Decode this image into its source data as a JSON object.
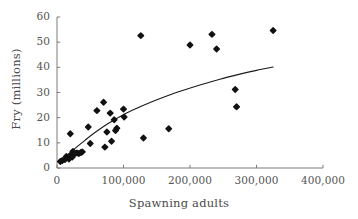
{
  "chart_data": {
    "type": "scatter",
    "title": "",
    "subtitle": "",
    "xlabel": "Spawning adults",
    "ylabel": "Fry (millions)",
    "xlim": [
      0,
      400000
    ],
    "ylim": [
      0,
      60
    ],
    "xticks": [
      0,
      100000,
      200000,
      300000,
      400000
    ],
    "xtick_labels": [
      "0",
      "100,000",
      "200,000",
      "300,000",
      "400,000"
    ],
    "yticks": [
      0,
      10,
      20,
      30,
      40,
      50,
      60
    ],
    "ytick_labels": [
      "0",
      "10",
      "20",
      "30",
      "40",
      "50",
      "60"
    ],
    "grid": false,
    "legend": null,
    "legend_position": "none",
    "marker": {
      "shape": "diamond",
      "color": "#111111",
      "size_px": 5.4
    },
    "series": [
      {
        "name": "Fry vs spawning adults",
        "type": "scatter",
        "points": [
          [
            5000,
            2.6
          ],
          [
            8000,
            3.0
          ],
          [
            12000,
            3.4
          ],
          [
            14000,
            4.6
          ],
          [
            18000,
            3.6
          ],
          [
            20000,
            13.6
          ],
          [
            21000,
            5.2
          ],
          [
            23000,
            4.4
          ],
          [
            24000,
            6.6
          ],
          [
            26000,
            5.6
          ],
          [
            30000,
            6.0
          ],
          [
            33000,
            5.8
          ],
          [
            36000,
            6.2
          ],
          [
            38000,
            6.4
          ],
          [
            47000,
            16.3
          ],
          [
            50000,
            9.7
          ],
          [
            60000,
            22.8
          ],
          [
            70000,
            26.1
          ],
          [
            72000,
            8.3
          ],
          [
            75000,
            14.3
          ],
          [
            80000,
            21.8
          ],
          [
            82000,
            10.6
          ],
          [
            86000,
            19.2
          ],
          [
            88000,
            14.9
          ],
          [
            90000,
            15.8
          ],
          [
            100000,
            23.4
          ],
          [
            101000,
            20.3
          ],
          [
            126000,
            52.6
          ],
          [
            130000,
            11.9
          ],
          [
            168000,
            15.6
          ],
          [
            200000,
            48.9
          ],
          [
            233000,
            53.1
          ],
          [
            240000,
            47.3
          ],
          [
            268000,
            31.2
          ],
          [
            270000,
            24.3
          ],
          [
            325000,
            54.6
          ]
        ]
      },
      {
        "name": "fitted curve",
        "type": "line",
        "color": "#1a1a1a",
        "width_px": 1.1,
        "points": [
          [
            5000,
            2.8
          ],
          [
            12000,
            4.4
          ],
          [
            20000,
            6.2
          ],
          [
            30000,
            8.4
          ],
          [
            42000,
            11.0
          ],
          [
            55000,
            13.7
          ],
          [
            70000,
            16.5
          ],
          [
            85000,
            19.0
          ],
          [
            100000,
            21.2
          ],
          [
            120000,
            23.7
          ],
          [
            140000,
            26.0
          ],
          [
            165000,
            28.6
          ],
          [
            190000,
            30.9
          ],
          [
            215000,
            33.0
          ],
          [
            245000,
            35.3
          ],
          [
            275000,
            37.3
          ],
          [
            300000,
            38.8
          ],
          [
            325000,
            40.1
          ]
        ]
      }
    ]
  },
  "figure": {
    "axis_color": "#6e6e6e",
    "background": "#ffffff"
  }
}
